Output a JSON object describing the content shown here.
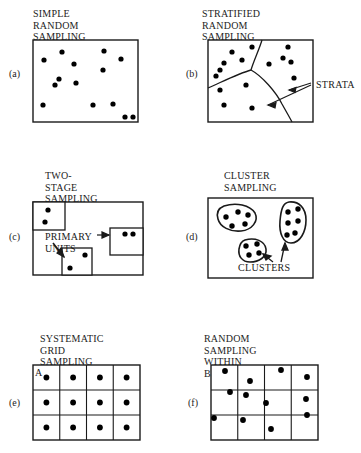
{
  "figure": {
    "title_style": "serif-uppercase",
    "ink_color": "#1a1a1a",
    "background_color": "#ffffff",
    "dot_color": "#000000",
    "width": 361,
    "height": 453
  },
  "panels": [
    {
      "tag": "(a)",
      "title": "SIMPLE RANDOM\nSAMPLING",
      "kind": "random-points",
      "frame": {
        "x": 33,
        "y": 40,
        "w": 105,
        "h": 82
      },
      "dot_count": 14,
      "dots": [
        {
          "x": 62,
          "y": 52
        },
        {
          "x": 44,
          "y": 60
        },
        {
          "x": 74,
          "y": 64
        },
        {
          "x": 104,
          "y": 51
        },
        {
          "x": 121,
          "y": 59
        },
        {
          "x": 103,
          "y": 70
        },
        {
          "x": 59,
          "y": 79
        },
        {
          "x": 55,
          "y": 85
        },
        {
          "x": 76,
          "y": 83
        },
        {
          "x": 43,
          "y": 105
        },
        {
          "x": 93,
          "y": 105
        },
        {
          "x": 113,
          "y": 104
        },
        {
          "x": 125,
          "y": 117
        },
        {
          "x": 133,
          "y": 117
        }
      ]
    },
    {
      "tag": "(b)",
      "title": "STRATIFIED RANDOM\nSAMPLING",
      "kind": "stratified",
      "frame": {
        "x": 208,
        "y": 40,
        "w": 105,
        "h": 82
      },
      "annotation": "STRATA",
      "annotation_pos": {
        "x": 316,
        "y": 79
      },
      "dot_count": 15,
      "dots": [
        {
          "x": 224,
          "y": 63
        },
        {
          "x": 232,
          "y": 52
        },
        {
          "x": 242,
          "y": 60
        },
        {
          "x": 252,
          "y": 47
        },
        {
          "x": 220,
          "y": 70
        },
        {
          "x": 216,
          "y": 76
        },
        {
          "x": 269,
          "y": 64
        },
        {
          "x": 288,
          "y": 47
        },
        {
          "x": 283,
          "y": 58
        },
        {
          "x": 291,
          "y": 62
        },
        {
          "x": 294,
          "y": 78
        },
        {
          "x": 220,
          "y": 90
        },
        {
          "x": 246,
          "y": 85
        },
        {
          "x": 224,
          "y": 105
        },
        {
          "x": 252,
          "y": 108
        }
      ]
    },
    {
      "tag": "(c)",
      "title": "TWO-STAGE\nSAMPLING",
      "kind": "two-stage",
      "frame": {
        "x": 33,
        "y": 202,
        "w": 110,
        "h": 73
      },
      "annotation_line1": "PRIMARY",
      "annotation_line2": "UNITS",
      "annotation_pos": {
        "x": 45,
        "y": 231
      },
      "subunits": [
        {
          "x": 33,
          "y": 202,
          "w": 32,
          "h": 28,
          "dots": [
            {
              "x": 48,
              "y": 210
            },
            {
              "x": 45,
              "y": 222
            }
          ]
        },
        {
          "x": 110,
          "y": 228,
          "w": 33,
          "h": 27,
          "dots": [
            {
              "x": 125,
              "y": 234
            },
            {
              "x": 133,
              "y": 234
            }
          ]
        },
        {
          "x": 62,
          "y": 248,
          "w": 30,
          "h": 27,
          "dots": [
            {
              "x": 85,
              "y": 255
            },
            {
              "x": 70,
              "y": 268
            }
          ]
        }
      ]
    },
    {
      "tag": "(d)",
      "title": "CLUSTER\nSAMPLING",
      "kind": "cluster",
      "frame": {
        "x": 208,
        "y": 198,
        "w": 105,
        "h": 80
      },
      "annotation": "CLUSTERS",
      "annotation_pos": {
        "x": 245,
        "y": 262
      },
      "clusters": [
        {
          "name": "upper-left-cluster",
          "dot_count": 5,
          "dots": [
            {
              "x": 226,
              "y": 217
            },
            {
              "x": 238,
              "y": 212
            },
            {
              "x": 248,
              "y": 215
            },
            {
              "x": 232,
              "y": 226
            },
            {
              "x": 245,
              "y": 224
            }
          ]
        },
        {
          "name": "right-cluster",
          "dot_count": 6,
          "dots": [
            {
              "x": 288,
              "y": 212
            },
            {
              "x": 298,
              "y": 209
            },
            {
              "x": 288,
              "y": 223
            },
            {
              "x": 298,
              "y": 221
            },
            {
              "x": 287,
              "y": 235
            },
            {
              "x": 295,
              "y": 233
            }
          ]
        },
        {
          "name": "lower-cluster",
          "dot_count": 4,
          "dots": [
            {
              "x": 246,
              "y": 246
            },
            {
              "x": 257,
              "y": 244
            },
            {
              "x": 249,
              "y": 255
            },
            {
              "x": 259,
              "y": 253
            }
          ]
        }
      ]
    },
    {
      "tag": "(e)",
      "title": "SYSTEMATIC GRID\nSAMPLING",
      "kind": "grid-systematic",
      "frame": {
        "x": 33,
        "y": 365,
        "w": 107,
        "h": 75
      },
      "grid": {
        "cols": 4,
        "rows": 3
      },
      "cell_letter": "A",
      "dot_count": 12,
      "placement": "centered-in-each-cell"
    },
    {
      "tag": "(f)",
      "title": "RANDOM SAMPLING\nWITHIN BLOCKS",
      "kind": "grid-random",
      "frame": {
        "x": 211,
        "y": 365,
        "w": 107,
        "h": 75
      },
      "grid": {
        "cols": 4,
        "rows": 3
      },
      "dot_count": 12,
      "placement": "one-random-point-per-cell",
      "dots": [
        {
          "x": 225,
          "y": 371
        },
        {
          "x": 250,
          "y": 381
        },
        {
          "x": 281,
          "y": 370
        },
        {
          "x": 307,
          "y": 377
        },
        {
          "x": 230,
          "y": 392
        },
        {
          "x": 246,
          "y": 395
        },
        {
          "x": 266,
          "y": 403
        },
        {
          "x": 306,
          "y": 399
        },
        {
          "x": 214,
          "y": 418
        },
        {
          "x": 243,
          "y": 420
        },
        {
          "x": 271,
          "y": 429
        },
        {
          "x": 307,
          "y": 415
        }
      ]
    }
  ]
}
